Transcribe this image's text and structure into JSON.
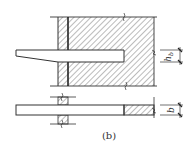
{
  "figure": {
    "caption": "(b)",
    "dimensions": {
      "beam_height_label_main": "h",
      "beam_height_label_sub": "b",
      "beam_width_label": "b"
    },
    "colors": {
      "line": "#333333",
      "hatch": "#555555",
      "background": "#ffffff"
    }
  }
}
